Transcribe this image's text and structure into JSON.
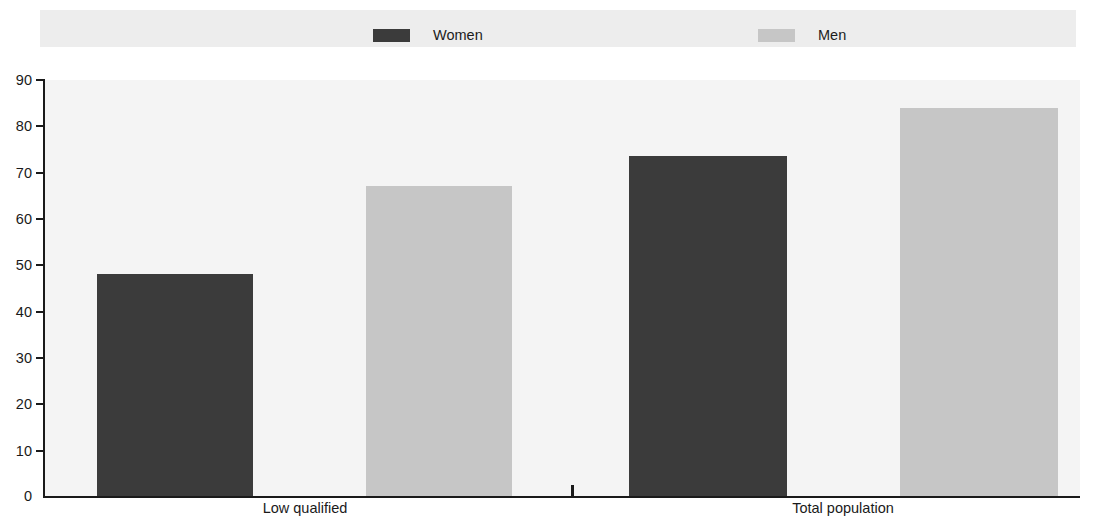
{
  "legend": {
    "entries": [
      {
        "label": "Women",
        "color": "#3b3b3b",
        "swatch_name": "legend-swatch-women"
      },
      {
        "label": "Men",
        "color": "#c6c6c6",
        "swatch_name": "legend-swatch-men"
      }
    ]
  },
  "axis": {
    "y_ticks": [
      "90",
      "80",
      "70",
      "60",
      "50",
      "40",
      "30",
      "20",
      "10",
      "0"
    ],
    "x_categories": [
      "Low qualified",
      "Total population"
    ]
  },
  "chart_data": {
    "type": "bar",
    "title": "",
    "subtitle": "",
    "xlabel": "",
    "ylabel": "",
    "ylim": [
      0,
      90
    ],
    "ytick_step": 10,
    "grid": false,
    "legend_position": "top",
    "categories": [
      "Low qualified",
      "Total population"
    ],
    "series": [
      {
        "name": "Women",
        "color": "#3b3b3b",
        "values": [
          48,
          73.5
        ]
      },
      {
        "name": "Men",
        "color": "#c6c6c6",
        "values": [
          67,
          84
        ]
      }
    ]
  }
}
